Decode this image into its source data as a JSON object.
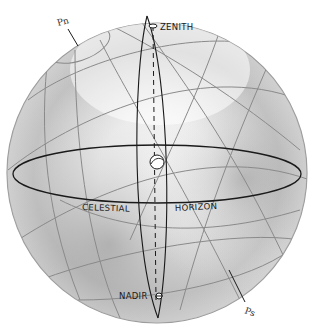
{
  "diagram": {
    "labels": {
      "zenith": "ZENITH",
      "nadir": "NADIR",
      "celestial": "CELESTIAL",
      "horizon": "HORIZON",
      "north_pole": "Pn",
      "south_pole": "Ps"
    },
    "colors": {
      "background": "#ffffff",
      "grid_lines": "#8a8a8a",
      "horizon_line": "#1a1a1a",
      "shading": "#9a9a9a"
    }
  }
}
